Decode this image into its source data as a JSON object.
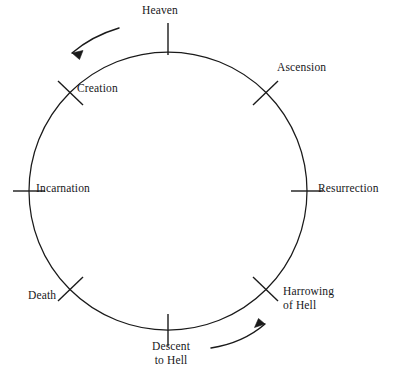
{
  "diagram": {
    "type": "cycle-diagram",
    "title": "",
    "background_color": "#ffffff",
    "stroke_color": "#1a1a1a",
    "text_color": "#17171a",
    "flow_direction": "counterclockwise",
    "circle": {
      "center_x": 168,
      "center_y": 191,
      "radius": 139
    },
    "nodes": [
      {
        "id": "heaven",
        "label": "Heaven",
        "angle_deg": 90,
        "tick": "vertical",
        "label_position": "above"
      },
      {
        "id": "creation",
        "label": "Creation",
        "angle_deg": 135,
        "tick": "diagonal-nw",
        "label_position": "right"
      },
      {
        "id": "incarnation",
        "label": "Incarnation",
        "angle_deg": 180,
        "tick": "horizontal",
        "label_position": "right"
      },
      {
        "id": "death",
        "label": "Death",
        "angle_deg": 225,
        "tick": "diagonal-sw",
        "label_position": "left"
      },
      {
        "id": "descent",
        "label": "Descent\nto Hell",
        "angle_deg": 270,
        "tick": "vertical",
        "label_position": "below"
      },
      {
        "id": "harrowing",
        "label": "Harrowing\nof Hell",
        "angle_deg": 315,
        "tick": "diagonal-se",
        "label_position": "right"
      },
      {
        "id": "resurrection",
        "label": "Resurrection",
        "angle_deg": 0,
        "tick": "horizontal",
        "label_position": "right"
      },
      {
        "id": "ascension",
        "label": "Ascension",
        "angle_deg": 45,
        "tick": "diagonal-ne",
        "label_position": "right"
      }
    ],
    "arrows": [
      {
        "id": "arrow-top-left",
        "direction": "counterclockwise",
        "points_toward": "down-left"
      },
      {
        "id": "arrow-bottom-right",
        "direction": "counterclockwise",
        "points_toward": "up-right"
      }
    ],
    "labels": {
      "heaven": "Heaven",
      "creation": "Creation",
      "incarnation": "Incarnation",
      "death": "Death",
      "descent_line1": "Descent",
      "descent_line2": "to Hell",
      "harrowing_line1": "Harrowing",
      "harrowing_line2": "of Hell",
      "resurrection": "Resurrection",
      "ascension": "Ascension"
    }
  }
}
